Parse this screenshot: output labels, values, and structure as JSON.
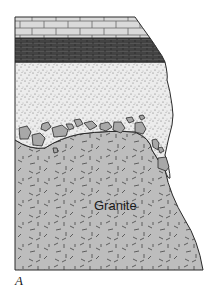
{
  "diagram": {
    "type": "geologic-cross-section",
    "figure_label": "A",
    "layers": [
      {
        "name": "limestone",
        "pattern": "brick",
        "color": "#d8d8d8"
      },
      {
        "name": "shale",
        "pattern": "dark-brick",
        "color": "#4a4a4a"
      },
      {
        "name": "sandstone",
        "pattern": "stipple",
        "color": "#e6e6e6"
      },
      {
        "name": "basal-conglomerate",
        "pattern": "cobbles",
        "color": "#e6e6e6"
      },
      {
        "name": "granite",
        "pattern": "dashes",
        "color": "#bdbdbd",
        "label": "Granite"
      }
    ],
    "colors": {
      "outline": "#2a2a2a",
      "limestone": "#d8d8d8",
      "shale": "#4a4a4a",
      "sandstone": "#e8e8e8",
      "cobble": "#a9a9a9",
      "granite": "#bcbcbc"
    }
  }
}
